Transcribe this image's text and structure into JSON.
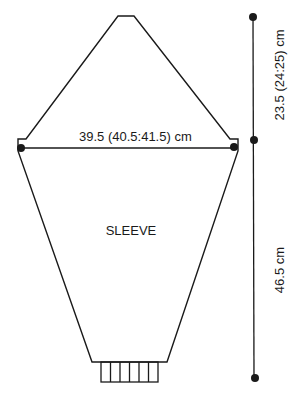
{
  "diagram": {
    "piece_label": "SLEEVE",
    "width_measurement": "39.5 (40.5:41.5) cm",
    "cap_height_measurement": "23.5 (24:25) cm",
    "sleeve_length_measurement": "46.5 cm",
    "colors": {
      "line": "#1a1a1a",
      "background": "#ffffff"
    }
  }
}
